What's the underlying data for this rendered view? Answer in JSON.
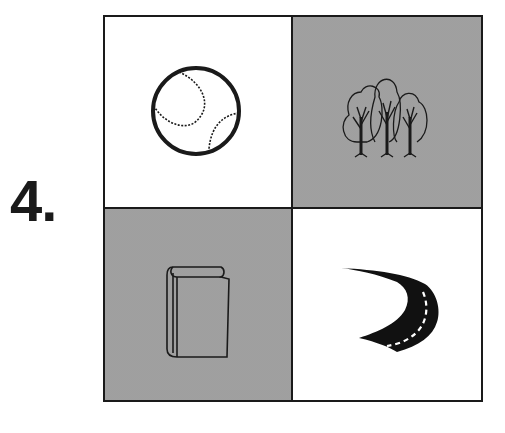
{
  "question": {
    "number_label": "4."
  },
  "grid": {
    "cells": [
      {
        "position": "top-left",
        "picture": "baseball",
        "background": "white"
      },
      {
        "position": "top-right",
        "picture": "trees",
        "background": "shaded"
      },
      {
        "position": "bottom-left",
        "picture": "book",
        "background": "shaded"
      },
      {
        "position": "bottom-right",
        "picture": "road",
        "background": "white"
      }
    ]
  },
  "colors": {
    "ink": "#1a1a1a",
    "shade": "#c8c8c8",
    "paper": "#ffffff"
  }
}
